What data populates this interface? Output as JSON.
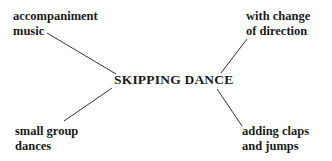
{
  "diagram": {
    "type": "mind-map",
    "center": "SKIPPING DANCE",
    "branches": [
      {
        "position": "top-left",
        "lines": [
          "accompaniment",
          "music"
        ]
      },
      {
        "position": "top-right",
        "lines": [
          "with change",
          "of direction"
        ]
      },
      {
        "position": "bottom-left",
        "lines": [
          "small group",
          "dances"
        ]
      },
      {
        "position": "bottom-right",
        "lines": [
          "adding claps",
          "and jumps"
        ]
      }
    ],
    "line_color": "#333333"
  }
}
